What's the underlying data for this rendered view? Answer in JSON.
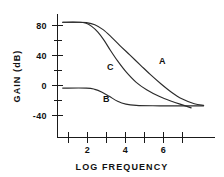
{
  "chart_data": {
    "type": "line",
    "title": "",
    "xlabel": "LOG FREQUENCY",
    "ylabel": "GAIN (dB)",
    "xlim": [
      0,
      7.6
    ],
    "ylim": [
      -60,
      90
    ],
    "grid": false,
    "legend_position": "inline-annotations",
    "x_ticks": [
      1,
      2,
      3,
      4,
      5,
      6,
      7
    ],
    "x_tick_labels": [
      "",
      "2",
      "",
      "4",
      "",
      "6",
      ""
    ],
    "y_ticks": [
      -60,
      -40,
      -20,
      0,
      20,
      40,
      60,
      80
    ],
    "y_tick_labels": [
      "",
      "-40",
      "",
      "0",
      "",
      "40",
      "",
      "80"
    ],
    "series": [
      {
        "name": "A",
        "label": "A",
        "label_x": 5.05,
        "label_y": 33,
        "points": [
          [
            0.25,
            80
          ],
          [
            1.0,
            80
          ],
          [
            1.4,
            79.5
          ],
          [
            1.8,
            77
          ],
          [
            2.2,
            71
          ],
          [
            2.6,
            62
          ],
          [
            3.0,
            52
          ],
          [
            3.5,
            40
          ],
          [
            4.0,
            28
          ],
          [
            4.5,
            16
          ],
          [
            5.0,
            5
          ],
          [
            5.5,
            -5
          ],
          [
            6.0,
            -13
          ],
          [
            6.6,
            -19
          ],
          [
            7.05,
            -21
          ]
        ]
      },
      {
        "name": "B",
        "label": "B",
        "label_x": 2.35,
        "label_y": -13,
        "points": [
          [
            0.25,
            0
          ],
          [
            1.4,
            0
          ],
          [
            1.8,
            -1.5
          ],
          [
            2.15,
            -5
          ],
          [
            2.5,
            -10
          ],
          [
            2.9,
            -16
          ],
          [
            3.3,
            -19.5
          ],
          [
            3.8,
            -21
          ],
          [
            4.6,
            -21.5
          ],
          [
            5.6,
            -21.5
          ],
          [
            6.6,
            -21.5
          ],
          [
            7.05,
            -21.5
          ]
        ]
      },
      {
        "name": "C",
        "label": "C",
        "label_x": 2.55,
        "label_y": 26,
        "points": [
          [
            0.25,
            80
          ],
          [
            1.0,
            80
          ],
          [
            1.35,
            79
          ],
          [
            1.65,
            75
          ],
          [
            1.95,
            68
          ],
          [
            2.25,
            58
          ],
          [
            2.55,
            46
          ],
          [
            2.9,
            33
          ],
          [
            3.3,
            20
          ],
          [
            3.8,
            7
          ],
          [
            4.3,
            -2
          ],
          [
            4.9,
            -10
          ],
          [
            5.5,
            -16
          ],
          [
            6.1,
            -21
          ],
          [
            6.45,
            -24
          ]
        ]
      }
    ]
  },
  "colors": {
    "axis": "#1a1a1a",
    "curve": "#2b2b2b",
    "text": "#111111",
    "background": "#ffffff"
  }
}
